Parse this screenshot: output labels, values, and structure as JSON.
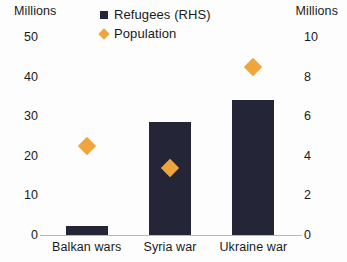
{
  "axes": {
    "left_unit": "Millions",
    "right_unit": "Millions"
  },
  "legend": {
    "items": [
      {
        "label": "Refugees (RHS)",
        "marker": "square-icon",
        "color": "#252538"
      },
      {
        "label": "Population",
        "marker": "diamond-icon",
        "color": "#eda53c"
      }
    ]
  },
  "chart_data": {
    "type": "bar",
    "title": "",
    "xlabel": "",
    "ylabel": "Millions",
    "y2label": "Millions",
    "categories": [
      "Balkan wars",
      "Syria war",
      "Ukraine war"
    ],
    "ylim": [
      0,
      50
    ],
    "y2lim": [
      0,
      10
    ],
    "yticks": [
      "0",
      "10",
      "20",
      "30",
      "40",
      "50"
    ],
    "y2ticks": [
      "0",
      "2",
      "4",
      "6",
      "8",
      "10"
    ],
    "grid": false,
    "legend_position": "top-center",
    "series": [
      {
        "name": "Population",
        "type": "bar",
        "axis": "left",
        "color": "#252538",
        "values": [
          2.3,
          28.5,
          34.0
        ]
      },
      {
        "name": "Refugees (RHS)",
        "type": "scatter",
        "axis": "right",
        "color": "#eda53c",
        "marker": "diamond",
        "values": [
          4.5,
          3.4,
          8.5
        ]
      }
    ]
  }
}
